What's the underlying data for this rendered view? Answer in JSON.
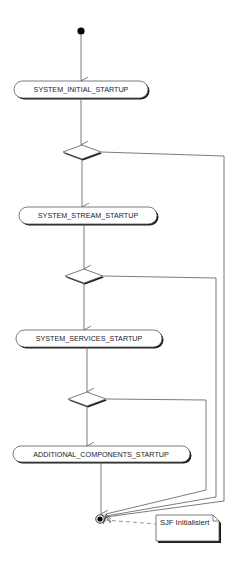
{
  "diagram": {
    "type": "UML activity diagram",
    "colors": {
      "line": "#5a5a5a",
      "shadow": "#1a1a1a",
      "fill": "#ffffff",
      "node": "#000000",
      "text": "#222222"
    },
    "start_node": {
      "x": 81,
      "y": 31
    },
    "actions": [
      {
        "id": "a1",
        "label": "SYSTEM_INITIAL_STARTUP",
        "x": 14,
        "y": 81,
        "w": 134,
        "h": 17
      },
      {
        "id": "a2",
        "label": "SYSTEM_STREAM_STARTUP",
        "x": 19,
        "y": 207,
        "w": 138,
        "h": 17
      },
      {
        "id": "a3",
        "label": "SYSTEM_SERVICES_STARTUP",
        "x": 16,
        "y": 330,
        "w": 146,
        "h": 17
      },
      {
        "id": "a4",
        "label": "ADDITIONAL_COMPONENTS_STARTUP",
        "x": 13,
        "y": 446,
        "w": 177,
        "h": 16
      }
    ],
    "decisions": [
      {
        "id": "d1",
        "cx": 82,
        "cy": 152,
        "hw": 19,
        "hh": 7
      },
      {
        "id": "d2",
        "cx": 84,
        "cy": 276,
        "hw": 19,
        "hh": 7
      },
      {
        "id": "d3",
        "cx": 87,
        "cy": 399,
        "hw": 19,
        "hh": 7
      }
    ],
    "final_node": {
      "x": 100,
      "y": 519
    },
    "note": {
      "text": "SJF Initialisiert",
      "x": 156,
      "y": 515,
      "w": 63,
      "h": 26
    }
  }
}
